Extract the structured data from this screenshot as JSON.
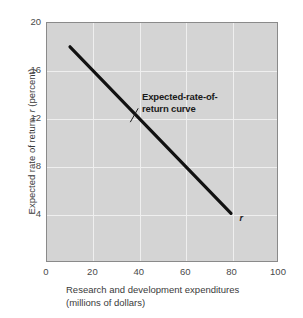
{
  "chart_data": {
    "type": "line",
    "title": "",
    "xlabel": "Research and development expenditures (millions of dollars)",
    "xlabel_line1": "Research and development expenditures",
    "xlabel_line2": "(millions of dollars)",
    "ylabel": "Expected rate of return, r (percent)",
    "ylabel_prefix": "Expected rate of return, ",
    "ylabel_symbol": "r",
    "ylabel_suffix": " (percent)",
    "xlim": [
      0,
      100
    ],
    "ylim": [
      0,
      20
    ],
    "xticks": [
      0,
      20,
      40,
      60,
      80,
      100
    ],
    "yticks": [
      4,
      8,
      12,
      16,
      20
    ],
    "grid": true,
    "legend": "none",
    "series": [
      {
        "name": "Expected-rate-of-return curve",
        "x": [
          10,
          80
        ],
        "values": [
          18,
          4
        ],
        "color": "#111111",
        "end_label": "r"
      }
    ],
    "annotations": [
      {
        "name": "expected-rate-of-return-curve",
        "line1": "Expected-rate-of-",
        "line2": "return curve",
        "x": 40,
        "y": 12.8
      }
    ]
  },
  "colors": {
    "plot_background": "#d4d4d4",
    "gridline": "#efefef",
    "border": "#8a8a8a",
    "curve": "#111111",
    "text": "#3a3a3a",
    "page_background": "#ffffff"
  }
}
